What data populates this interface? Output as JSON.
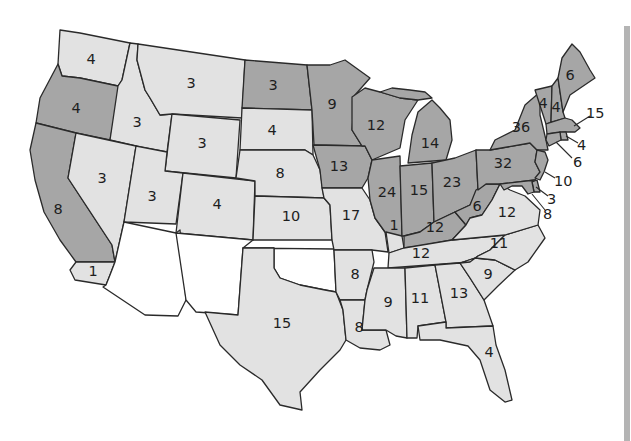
{
  "map": {
    "title": "",
    "colors": {
      "dark": "#a6a6a6",
      "light": "#e2e2e2",
      "none": "#ffffff",
      "border": "#2a2a2a",
      "background": "#ffffff"
    },
    "legend": [],
    "states": [
      {
        "id": "WA",
        "votes": "4",
        "fill": "light"
      },
      {
        "id": "OR",
        "votes": "4",
        "fill": "dark"
      },
      {
        "id": "CA",
        "votes": "8",
        "fill": "dark"
      },
      {
        "id": "CA-south",
        "votes": "1",
        "fill": "light"
      },
      {
        "id": "ID",
        "votes": "3",
        "fill": "light"
      },
      {
        "id": "NV",
        "votes": "3",
        "fill": "light"
      },
      {
        "id": "MT",
        "votes": "3",
        "fill": "light"
      },
      {
        "id": "WY",
        "votes": "3",
        "fill": "light"
      },
      {
        "id": "UT",
        "votes": "3",
        "fill": "light"
      },
      {
        "id": "CO",
        "votes": "4",
        "fill": "light"
      },
      {
        "id": "AZ",
        "votes": "",
        "fill": "none"
      },
      {
        "id": "NM",
        "votes": "",
        "fill": "none"
      },
      {
        "id": "ND",
        "votes": "3",
        "fill": "dark"
      },
      {
        "id": "SD",
        "votes": "4",
        "fill": "light"
      },
      {
        "id": "NE",
        "votes": "8",
        "fill": "light"
      },
      {
        "id": "KS",
        "votes": "10",
        "fill": "light"
      },
      {
        "id": "OK",
        "votes": "",
        "fill": "none"
      },
      {
        "id": "TX",
        "votes": "15",
        "fill": "light"
      },
      {
        "id": "MN",
        "votes": "9",
        "fill": "dark"
      },
      {
        "id": "IA",
        "votes": "13",
        "fill": "dark"
      },
      {
        "id": "MO",
        "votes": "17",
        "fill": "light"
      },
      {
        "id": "AR",
        "votes": "8",
        "fill": "light"
      },
      {
        "id": "LA",
        "votes": "8",
        "fill": "light"
      },
      {
        "id": "WI",
        "votes": "12",
        "fill": "dark"
      },
      {
        "id": "IL",
        "votes": "24",
        "fill": "dark"
      },
      {
        "id": "KY-split",
        "votes": "1",
        "fill": "light"
      },
      {
        "id": "MI",
        "votes": "14",
        "fill": "dark"
      },
      {
        "id": "IN",
        "votes": "15",
        "fill": "dark"
      },
      {
        "id": "OH",
        "votes": "23",
        "fill": "dark"
      },
      {
        "id": "KY",
        "votes": "12",
        "fill": "dark"
      },
      {
        "id": "TN",
        "votes": "12",
        "fill": "light"
      },
      {
        "id": "MS",
        "votes": "9",
        "fill": "light"
      },
      {
        "id": "AL",
        "votes": "11",
        "fill": "light"
      },
      {
        "id": "GA",
        "votes": "13",
        "fill": "light"
      },
      {
        "id": "FL",
        "votes": "4",
        "fill": "light"
      },
      {
        "id": "SC",
        "votes": "9",
        "fill": "light"
      },
      {
        "id": "NC",
        "votes": "11",
        "fill": "light"
      },
      {
        "id": "VA",
        "votes": "12",
        "fill": "light"
      },
      {
        "id": "WV",
        "votes": "6",
        "fill": "dark"
      },
      {
        "id": "PA",
        "votes": "32",
        "fill": "dark"
      },
      {
        "id": "NY",
        "votes": "36",
        "fill": "dark"
      },
      {
        "id": "VT",
        "votes": "4",
        "fill": "dark"
      },
      {
        "id": "NH",
        "votes": "4",
        "fill": "dark"
      },
      {
        "id": "ME",
        "votes": "6",
        "fill": "dark"
      },
      {
        "id": "MA",
        "votes": "15",
        "fill": "dark"
      },
      {
        "id": "RI",
        "votes": "4",
        "fill": "dark"
      },
      {
        "id": "CT",
        "votes": "6",
        "fill": "dark"
      },
      {
        "id": "NJ",
        "votes": "10",
        "fill": "dark"
      },
      {
        "id": "DE",
        "votes": "3",
        "fill": "dark"
      },
      {
        "id": "MD",
        "votes": "8",
        "fill": "dark"
      }
    ]
  }
}
